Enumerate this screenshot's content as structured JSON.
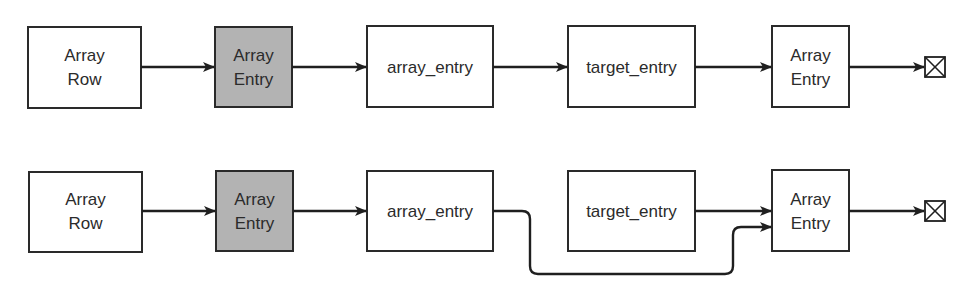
{
  "diagram": {
    "title": "",
    "colors": {
      "stroke": "#1f1f1f",
      "shaded_fill": "#b3b3b3",
      "text": "#2b2b2b",
      "background": "#ffffff"
    },
    "rows": [
      {
        "id": "top",
        "nodes": [
          {
            "id": "t1",
            "lines": [
              "Array",
              "Row"
            ],
            "shaded": false,
            "x": 28,
            "y": 27,
            "w": 113,
            "h": 81
          },
          {
            "id": "t2",
            "lines": [
              "Array",
              "Entry"
            ],
            "shaded": true,
            "x": 215,
            "y": 27,
            "w": 77,
            "h": 80
          },
          {
            "id": "t3",
            "lines": [
              "array_entry"
            ],
            "shaded": false,
            "x": 367,
            "y": 26,
            "w": 126,
            "h": 81
          },
          {
            "id": "t4",
            "lines": [
              "target_entry"
            ],
            "shaded": false,
            "x": 568,
            "y": 26,
            "w": 127,
            "h": 81
          },
          {
            "id": "t5",
            "lines": [
              "Array",
              "Entry"
            ],
            "shaded": false,
            "x": 772,
            "y": 26,
            "w": 77,
            "h": 81
          }
        ],
        "edges": [
          {
            "from": "t1",
            "to": "t2"
          },
          {
            "from": "t2",
            "to": "t3"
          },
          {
            "from": "t3",
            "to": "t4"
          },
          {
            "from": "t4",
            "to": "t5"
          },
          {
            "from": "t5",
            "to": "terminator"
          }
        ],
        "terminator": {
          "icon": "boxed-x-terminator-icon",
          "x": 925,
          "y": 57,
          "size": 20
        }
      },
      {
        "id": "bottom",
        "nodes": [
          {
            "id": "b1",
            "lines": [
              "Array",
              "Row"
            ],
            "shaded": false,
            "x": 29,
            "y": 172,
            "w": 113,
            "h": 80
          },
          {
            "id": "b2",
            "lines": [
              "Array",
              "Entry"
            ],
            "shaded": true,
            "x": 216,
            "y": 171,
            "w": 77,
            "h": 80
          },
          {
            "id": "b3",
            "lines": [
              "array_entry"
            ],
            "shaded": false,
            "x": 367,
            "y": 171,
            "w": 126,
            "h": 80
          },
          {
            "id": "b4",
            "lines": [
              "target_entry"
            ],
            "shaded": false,
            "x": 568,
            "y": 171,
            "w": 127,
            "h": 80
          },
          {
            "id": "b5",
            "lines": [
              "Array",
              "Entry"
            ],
            "shaded": false,
            "x": 772,
            "y": 170,
            "w": 77,
            "h": 81
          }
        ],
        "edges": [
          {
            "from": "b1",
            "to": "b2"
          },
          {
            "from": "b2",
            "to": "b3"
          },
          {
            "from": "b3",
            "to": "b5",
            "routed": true,
            "note": "routes below target_entry"
          },
          {
            "from": "b4",
            "to": "b5"
          },
          {
            "from": "b5",
            "to": "terminator"
          }
        ],
        "terminator": {
          "icon": "boxed-x-terminator-icon",
          "x": 925,
          "y": 201,
          "size": 20
        }
      }
    ]
  },
  "labels": {
    "top_array_row_1": "Array",
    "top_array_row_2": "Row",
    "top_array_entry_shaded_1": "Array",
    "top_array_entry_shaded_2": "Entry",
    "top_array_entry_var": "array_entry",
    "top_target_entry": "target_entry",
    "top_array_entry_final_1": "Array",
    "top_array_entry_final_2": "Entry",
    "bottom_array_row_1": "Array",
    "bottom_array_row_2": "Row",
    "bottom_array_entry_shaded_1": "Array",
    "bottom_array_entry_shaded_2": "Entry",
    "bottom_array_entry_var": "array_entry",
    "bottom_target_entry": "target_entry",
    "bottom_array_entry_final_1": "Array",
    "bottom_array_entry_final_2": "Entry"
  }
}
